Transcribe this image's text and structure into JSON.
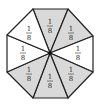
{
  "diagram": {
    "shape": "octagon",
    "center": [
      50,
      53
    ],
    "vertices": [
      [
        33,
        9
      ],
      [
        68,
        9
      ],
      [
        93,
        36
      ],
      [
        93,
        72
      ],
      [
        68,
        98
      ],
      [
        33,
        98
      ],
      [
        7,
        72
      ],
      [
        7,
        35
      ]
    ],
    "colors": {
      "shaded": "#d9d9d9",
      "unshaded": "#ffffff",
      "stroke": "#222222"
    },
    "sections": [
      {
        "id": "top",
        "numerator": "1",
        "denominator": "8",
        "shaded": true,
        "label_pos": [
          50,
          26
        ]
      },
      {
        "id": "upper-right",
        "numerator": "1",
        "denominator": "8",
        "shaded": true,
        "label_pos": [
          71,
          33
        ]
      },
      {
        "id": "right",
        "numerator": "1",
        "denominator": "8",
        "shaded": false,
        "label_pos": [
          78,
          53
        ]
      },
      {
        "id": "lower-right",
        "numerator": "1",
        "denominator": "8",
        "shaded": true,
        "label_pos": [
          71,
          74
        ]
      },
      {
        "id": "bottom",
        "numerator": "1",
        "denominator": "8",
        "shaded": true,
        "label_pos": [
          50,
          81
        ]
      },
      {
        "id": "lower-left",
        "numerator": "1",
        "denominator": "8",
        "shaded": true,
        "label_pos": [
          29,
          74
        ]
      },
      {
        "id": "left",
        "numerator": "1",
        "denominator": "8",
        "shaded": false,
        "label_pos": [
          23,
          53
        ]
      },
      {
        "id": "upper-left",
        "numerator": "1",
        "denominator": "8",
        "shaded": false,
        "label_pos": [
          29,
          33
        ]
      }
    ]
  }
}
